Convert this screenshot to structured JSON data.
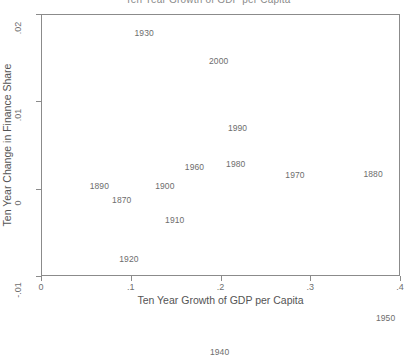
{
  "chart_data": {
    "type": "scatter",
    "title": "Ten Year Growth of GDP per Capita",
    "xlabel": "Ten Year Growth of GDP per Capita",
    "ylabel": "Ten Year Change in Finance Share",
    "xlim": [
      0,
      0.4
    ],
    "ylim": [
      -0.01,
      0.02
    ],
    "xticks": [
      0,
      0.1,
      0.2,
      0.3,
      0.4
    ],
    "xticklabels": [
      "0",
      ".1",
      ".2",
      ".3",
      ".4"
    ],
    "yticks": [
      -0.01,
      0,
      0.01,
      0.02
    ],
    "yticklabels": [
      "-.01",
      "0",
      ".01",
      ".02"
    ],
    "grid": false,
    "legend": false,
    "marker_style": "text-label",
    "points": [
      {
        "label": "1930",
        "x": 0.115,
        "y": 0.0178
      },
      {
        "label": "2000",
        "x": 0.198,
        "y": 0.0146
      },
      {
        "label": "1990",
        "x": 0.219,
        "y": 0.0069
      },
      {
        "label": "1980",
        "x": 0.217,
        "y": 0.0028
      },
      {
        "label": "1960",
        "x": 0.171,
        "y": 0.0025
      },
      {
        "label": "1880",
        "x": 0.37,
        "y": 0.0017
      },
      {
        "label": "1970",
        "x": 0.283,
        "y": 0.0016
      },
      {
        "label": "1890",
        "x": 0.065,
        "y": 0.0003
      },
      {
        "label": "1900",
        "x": 0.138,
        "y": 0.0003
      },
      {
        "label": "1870",
        "x": 0.09,
        "y": -0.0013
      },
      {
        "label": "1910",
        "x": 0.149,
        "y": -0.0036
      },
      {
        "label": "1920",
        "x": 0.098,
        "y": -0.008
      },
      {
        "label": "1950",
        "x": 0.384,
        "y": -0.0148
      },
      {
        "label": "1940",
        "x": 0.199,
        "y": -0.0187
      }
    ]
  },
  "colors": {
    "frame": "#8b8b8b",
    "text": "#6d6d6d",
    "axis_title": "#545454",
    "background": "#ffffff"
  }
}
